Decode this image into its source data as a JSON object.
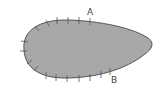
{
  "diagram": {
    "shape": "teardrop-surface",
    "fill_color": "#a8a8a8",
    "stroke_color": "#555555",
    "labels": [
      {
        "id": "A",
        "text": "A",
        "x": 87,
        "y": 8
      },
      {
        "id": "B",
        "text": "B",
        "x": 111,
        "y": 76
      }
    ]
  }
}
